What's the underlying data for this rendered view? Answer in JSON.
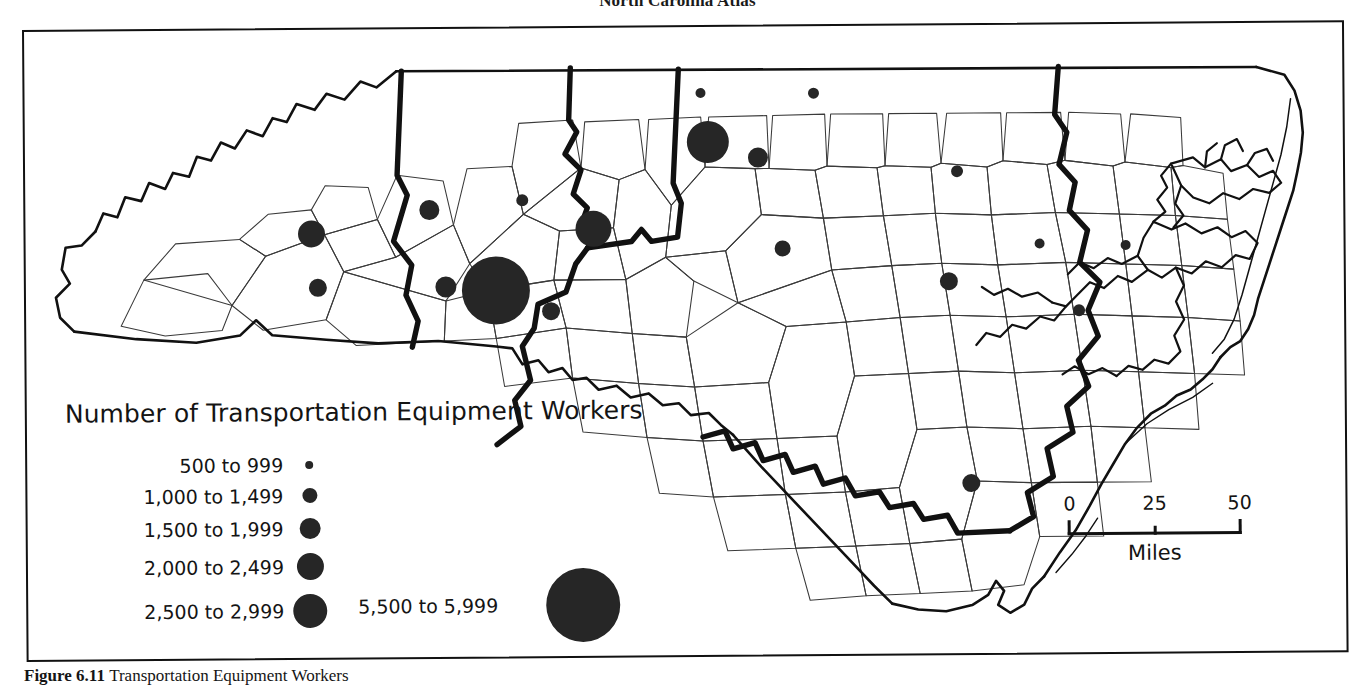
{
  "page": {
    "running_head": "North Carolina Atlas",
    "caption_figure": "Figure 6.11",
    "caption_text": "Transportation Equipment Workers"
  },
  "legend": {
    "title": "Number of Transportation Equipment Workers",
    "classes": [
      {
        "label": "500 to 999",
        "size_px": 8,
        "row_h": 30
      },
      {
        "label": "1,000 to 1,499",
        "size_px": 15,
        "row_h": 31
      },
      {
        "label": "1,500 to 1,999",
        "size_px": 21,
        "row_h": 35
      },
      {
        "label": "2,000 to 2,499",
        "size_px": 27,
        "row_h": 41
      },
      {
        "label": "2,500 to 2,999",
        "size_px": 34,
        "row_h": 48
      }
    ],
    "large_class": {
      "label": "5,500 to 5,999",
      "size_px": 74
    }
  },
  "scale": {
    "tick_0": "0",
    "tick_25": "25",
    "tick_50": "50",
    "units": "Miles"
  },
  "colors": {
    "symbol_fill": "#262626",
    "county_line": "#3a3a3a",
    "region_line": "#111111",
    "state_line": "#111111",
    "frame": "#111111",
    "background": "#ffffff"
  },
  "chart_data": {
    "type": "scatter",
    "title": "Number of Transportation Equipment Workers",
    "xlabel": "",
    "ylabel": "",
    "map_region": "North Carolina counties",
    "symbol": "graduated circle (proportional symbol)",
    "legend_position": "lower-left",
    "grid": false,
    "class_breaks": [
      {
        "range": "500 to 999",
        "min": 500,
        "max": 999,
        "diameter_px": 8
      },
      {
        "range": "1,000 to 1,499",
        "min": 1000,
        "max": 1499,
        "diameter_px": 15
      },
      {
        "range": "1,500 to 1,999",
        "min": 1500,
        "max": 1999,
        "diameter_px": 21
      },
      {
        "range": "2,000 to 2,499",
        "min": 2000,
        "max": 2499,
        "diameter_px": 27
      },
      {
        "range": "2,500 to 2,999",
        "min": 2500,
        "max": 2999,
        "diameter_px": 34
      },
      {
        "range": "5,500 to 5,999",
        "min": 5500,
        "max": 5999,
        "diameter_px": 74
      }
    ],
    "points": [
      {
        "x": 286,
        "y": 204,
        "r": 13.5,
        "class": "1,500 to 1,999"
      },
      {
        "x": 292,
        "y": 258,
        "r": 9,
        "class": "1,000 to 1,499"
      },
      {
        "x": 404,
        "y": 181,
        "r": 10,
        "class": "1,000 to 1,499"
      },
      {
        "x": 420,
        "y": 258,
        "r": 10.5,
        "class": "1,000 to 1,499"
      },
      {
        "x": 470,
        "y": 262,
        "r": 34,
        "class": "5,500 to 5,999"
      },
      {
        "x": 525,
        "y": 283,
        "r": 9,
        "class": "1,000 to 1,499"
      },
      {
        "x": 497,
        "y": 172,
        "r": 6,
        "class": "500 to 999"
      },
      {
        "x": 568,
        "y": 201,
        "r": 18,
        "class": "2,500 to 2,999"
      },
      {
        "x": 676,
        "y": 66,
        "r": 5,
        "class": "500 to 999"
      },
      {
        "x": 789,
        "y": 67,
        "r": 5.5,
        "class": "500 to 999"
      },
      {
        "x": 683,
        "y": 115,
        "r": 21,
        "class": "2,500 to 2,999"
      },
      {
        "x": 733,
        "y": 131,
        "r": 10,
        "class": "1,000 to 1,499"
      },
      {
        "x": 757,
        "y": 222,
        "r": 8,
        "class": "1,000 to 1,499"
      },
      {
        "x": 932,
        "y": 146,
        "r": 6,
        "class": "500 to 999"
      },
      {
        "x": 1014,
        "y": 219,
        "r": 5,
        "class": "500 to 999"
      },
      {
        "x": 1100,
        "y": 221,
        "r": 5,
        "class": "500 to 999"
      },
      {
        "x": 923,
        "y": 256,
        "r": 9,
        "class": "1,000 to 1,499"
      },
      {
        "x": 1053,
        "y": 286,
        "r": 6,
        "class": "500 to 999"
      },
      {
        "x": 944,
        "y": 458,
        "r": 9,
        "class": "1,000 to 1,499"
      }
    ]
  }
}
